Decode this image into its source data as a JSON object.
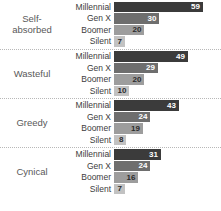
{
  "chart_data": {
    "type": "bar",
    "title": "",
    "subtitle": "",
    "xlabel": "",
    "ylabel": "",
    "orientation": "horizontal",
    "grid": false,
    "legend": "none",
    "xlim": [
      0,
      70
    ],
    "categories": [
      "Self-absorbed",
      "Wasteful",
      "Greedy",
      "Cynical"
    ],
    "series": [
      {
        "name": "Millennial",
        "values": [
          59,
          49,
          43,
          31
        ]
      },
      {
        "name": "Gen X",
        "values": [
          30,
          29,
          24,
          24
        ]
      },
      {
        "name": "Boomer",
        "values": [
          20,
          20,
          19,
          16
        ]
      },
      {
        "name": "Silent",
        "values": [
          7,
          10,
          8,
          7
        ]
      }
    ],
    "colors": {
      "Millennial": "#3b3b3b",
      "Gen X": "#6e6e6e",
      "Boomer": "#9d9d9d",
      "Silent": "#c2c2c2"
    },
    "groups": [
      {
        "label": "Self-\nabsorbed",
        "rows": [
          {
            "generation": "Millennial",
            "value": "59",
            "pct": 59
          },
          {
            "generation": "Gen X",
            "value": "30",
            "pct": 30
          },
          {
            "generation": "Boomer",
            "value": "20",
            "pct": 20
          },
          {
            "generation": "Silent",
            "value": "7",
            "pct": 7
          }
        ]
      },
      {
        "label": "Wasteful",
        "rows": [
          {
            "generation": "Millennial",
            "value": "49",
            "pct": 49
          },
          {
            "generation": "Gen X",
            "value": "29",
            "pct": 29
          },
          {
            "generation": "Boomer",
            "value": "20",
            "pct": 20
          },
          {
            "generation": "Silent",
            "value": "10",
            "pct": 10
          }
        ]
      },
      {
        "label": "Greedy",
        "rows": [
          {
            "generation": "Millennial",
            "value": "43",
            "pct": 43
          },
          {
            "generation": "Gen X",
            "value": "24",
            "pct": 24
          },
          {
            "generation": "Boomer",
            "value": "19",
            "pct": 19
          },
          {
            "generation": "Silent",
            "value": "8",
            "pct": 8
          }
        ]
      },
      {
        "label": "Cynical",
        "rows": [
          {
            "generation": "Millennial",
            "value": "31",
            "pct": 31
          },
          {
            "generation": "Gen X",
            "value": "24",
            "pct": 24
          },
          {
            "generation": "Boomer",
            "value": "16",
            "pct": 16
          },
          {
            "generation": "Silent",
            "value": "7",
            "pct": 7
          }
        ]
      }
    ]
  }
}
